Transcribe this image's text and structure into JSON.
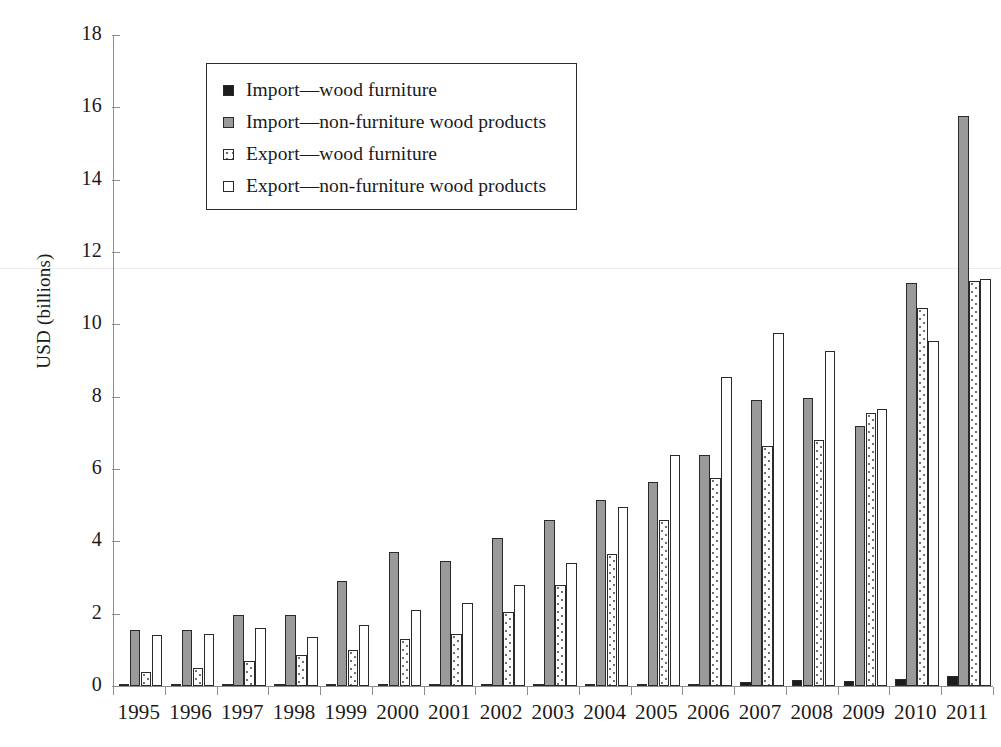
{
  "chart_data": {
    "type": "bar",
    "title": "",
    "xlabel": "",
    "ylabel": "USD (billions)",
    "ylim": [
      0,
      18
    ],
    "ytick_step": 2,
    "yticks": [
      0,
      2,
      4,
      6,
      8,
      10,
      12,
      14,
      16,
      18
    ],
    "grid": false,
    "legend_position": "upper-left-inside",
    "categories": [
      "1995",
      "1996",
      "1997",
      "1998",
      "1999",
      "2000",
      "2001",
      "2002",
      "2003",
      "2004",
      "2005",
      "2006",
      "2007",
      "2008",
      "2009",
      "2010",
      "2011"
    ],
    "series": [
      {
        "name": "Import—wood furniture",
        "style": "solid-black",
        "color": "#1c1c1c",
        "values": [
          0.01,
          0.01,
          0.01,
          0.01,
          0.01,
          0.02,
          0.02,
          0.02,
          0.03,
          0.04,
          0.05,
          0.06,
          0.1,
          0.17,
          0.15,
          0.2,
          0.28
        ]
      },
      {
        "name": "Import—non-furniture wood products",
        "style": "solid-gray",
        "color": "#9a9a9a",
        "values": [
          1.55,
          1.55,
          1.95,
          1.95,
          2.9,
          3.7,
          3.45,
          4.1,
          4.6,
          5.15,
          5.65,
          6.4,
          7.9,
          7.95,
          7.2,
          11.15,
          15.75
        ]
      },
      {
        "name": "Export—wood furniture",
        "style": "dotted",
        "color": "#ffffff",
        "values": [
          0.4,
          0.5,
          0.7,
          0.85,
          1.0,
          1.3,
          1.45,
          2.05,
          2.8,
          3.65,
          4.6,
          5.75,
          6.65,
          6.8,
          7.55,
          10.45,
          11.2
        ]
      },
      {
        "name": "Export—non-furniture wood products",
        "style": "white",
        "color": "#ffffff",
        "values": [
          1.4,
          1.45,
          1.6,
          1.35,
          1.7,
          2.1,
          2.3,
          2.8,
          3.4,
          4.95,
          6.4,
          8.55,
          9.75,
          9.25,
          7.65,
          9.55,
          11.25
        ]
      }
    ]
  },
  "axes": {
    "y_title": "USD (billions)"
  },
  "legend": {
    "items": [
      {
        "label": "Import—wood furniture"
      },
      {
        "label": "Import—non-furniture wood products"
      },
      {
        "label": "Export—wood furniture"
      },
      {
        "label": "Export—non-furniture wood products"
      }
    ]
  }
}
